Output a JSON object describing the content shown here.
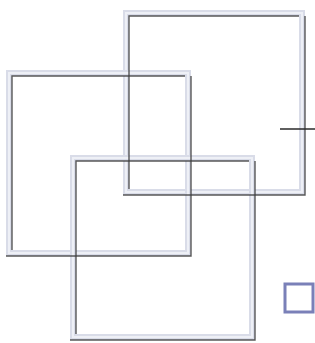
{
  "diagram": {
    "title": "Overlapping squares",
    "background": "#ffffff",
    "frame_color": "#d9dce8",
    "frame_highlight": "#eef0f6",
    "inner_line_color": "#3c3c3c",
    "frame_width": 6,
    "squares": [
      {
        "id": "square-top-right",
        "x": 123,
        "y": 10,
        "w": 182,
        "h": 185
      },
      {
        "id": "square-middle-left",
        "x": 6,
        "y": 70,
        "w": 185,
        "h": 186
      },
      {
        "id": "square-bottom-center",
        "x": 70,
        "y": 155,
        "w": 185,
        "h": 185
      }
    ],
    "tick_line": {
      "x1": 280,
      "y1": 129,
      "x2": 315,
      "y2": 129,
      "color": "#2a2a2a"
    },
    "small_square": {
      "x": 285,
      "y": 284,
      "w": 28,
      "h": 28,
      "border_color": "#7a80b8",
      "border_width": 3
    }
  }
}
